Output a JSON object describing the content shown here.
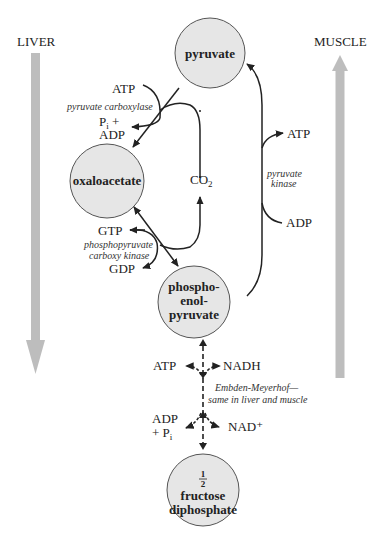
{
  "colors": {
    "node_fill": "#e6e6e6",
    "node_stroke": "#555555",
    "side_arrow": "#bdbdbd",
    "line": "#222222"
  },
  "sides": {
    "left": {
      "label": "LIVER",
      "direction": "down"
    },
    "right": {
      "label": "MUSCLE",
      "direction": "up"
    }
  },
  "nodes": {
    "pyruvate": {
      "label": "pyruvate"
    },
    "oxaloacetate": {
      "label": "oxaloacetate"
    },
    "pep": {
      "line1": "phospho-",
      "line2": "enol-",
      "line3": "pyruvate"
    },
    "fdp": {
      "fraction": "1/2",
      "frac_num": "1",
      "frac_den": "2",
      "line1": "fructose",
      "line2": "diphosphate"
    }
  },
  "reactions": {
    "pyruvate_carboxylase": {
      "enzyme": "pyruvate carboxylase",
      "in": "ATP",
      "out_line1": "Pi +",
      "out_line2": "ADP"
    },
    "co2": {
      "label": "CO₂"
    },
    "pepck": {
      "enzyme_line1": "phosphopyruvate",
      "enzyme_line2": "carboxy kinase",
      "in": "GTP",
      "out": "GDP"
    },
    "pyruvate_kinase": {
      "enzyme_line1": "pyruvate",
      "enzyme_line2": "kinase",
      "out": "ATP",
      "in": "ADP"
    },
    "embden_meyerhof": {
      "note_line1": "Embden-Meyerhof—",
      "note_line2": "same in liver and muscle",
      "upper_left": "ATP",
      "upper_right": "NADH",
      "lower_left_line1": "ADP",
      "lower_left_line2": "+ Pi",
      "lower_right": "NAD⁺"
    }
  }
}
